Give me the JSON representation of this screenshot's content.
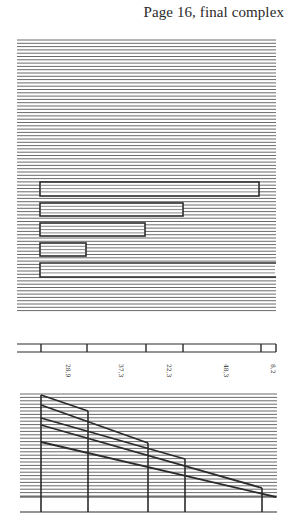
{
  "header": {
    "title": "Page 16, final complex"
  },
  "colors": {
    "ink": "#2b2b2b",
    "stripe": "#6a6a6a",
    "paper": "#ffffff"
  },
  "chart_data": [
    {
      "type": "bar",
      "orientation": "horizontal",
      "title": "",
      "categories": [
        "1",
        "2",
        "3",
        "4",
        "5"
      ],
      "values": [
        48.3,
        37.3,
        28.9,
        8.2,
        22.3
      ],
      "note": "Five outlined horizontal bars on a finely striped background; bottom bar runs off the right edge",
      "grid": true,
      "bars_px": [
        {
          "y": 182,
          "h": 14,
          "x0": 40,
          "x1": 259
        },
        {
          "y": 203,
          "h": 13,
          "x0": 40,
          "x1": 183
        },
        {
          "y": 223,
          "h": 13,
          "x0": 40,
          "x1": 145
        },
        {
          "y": 243,
          "h": 13,
          "x0": 40,
          "x1": 86
        },
        {
          "y": 263,
          "h": 14,
          "x0": 40,
          "x1": 276
        }
      ]
    },
    {
      "type": "table",
      "title": "",
      "orientation": "segmented strip",
      "labels": [
        "28,9",
        "37,3",
        "22,3",
        "48,3",
        "8,2"
      ],
      "segment_ticks_px": [
        41,
        87,
        146,
        183,
        261,
        276
      ]
    },
    {
      "type": "line",
      "title": "",
      "x_positions_px": [
        41,
        88,
        148,
        185,
        262
      ],
      "series": [
        {
          "name": "line-1",
          "from": [
            41,
            395
          ],
          "to": [
            88,
            411
          ]
        },
        {
          "name": "line-2",
          "from": [
            41,
            405
          ],
          "to": [
            148,
            443
          ]
        },
        {
          "name": "line-3",
          "from": [
            41,
            418
          ],
          "to": [
            185,
            459
          ]
        },
        {
          "name": "line-4",
          "from": [
            41,
            425
          ],
          "to": [
            262,
            488
          ]
        },
        {
          "name": "line-5",
          "from": [
            41,
            442
          ],
          "to": [
            276,
            497
          ]
        }
      ],
      "grid": true
    }
  ]
}
